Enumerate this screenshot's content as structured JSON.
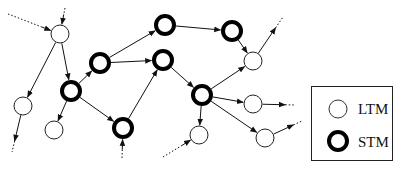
{
  "diagram": {
    "type": "network-graph",
    "node_types": {
      "ltm": {
        "label": "LTM",
        "stroke_width": 1,
        "stroke": "#222222"
      },
      "stm": {
        "label": "STM",
        "stroke_width": 4,
        "stroke": "#000000"
      }
    },
    "nodes": [
      {
        "id": "A",
        "type": "ltm",
        "x": 60,
        "y": 34
      },
      {
        "id": "B",
        "type": "ltm",
        "x": 23,
        "y": 106
      },
      {
        "id": "C",
        "type": "ltm",
        "x": 54,
        "y": 130
      },
      {
        "id": "D",
        "type": "stm",
        "x": 71,
        "y": 91
      },
      {
        "id": "E",
        "type": "stm",
        "x": 100,
        "y": 63
      },
      {
        "id": "F",
        "type": "stm",
        "x": 165,
        "y": 25
      },
      {
        "id": "G",
        "type": "stm",
        "x": 163,
        "y": 60
      },
      {
        "id": "H",
        "type": "stm",
        "x": 123,
        "y": 128
      },
      {
        "id": "I",
        "type": "stm",
        "x": 232,
        "y": 31
      },
      {
        "id": "J",
        "type": "ltm",
        "x": 253,
        "y": 61
      },
      {
        "id": "K",
        "type": "stm",
        "x": 202,
        "y": 95
      },
      {
        "id": "L",
        "type": "ltm",
        "x": 253,
        "y": 104
      },
      {
        "id": "M",
        "type": "ltm",
        "x": 199,
        "y": 135
      },
      {
        "id": "N",
        "type": "ltm",
        "x": 265,
        "y": 138
      }
    ],
    "edges": [
      [
        "A",
        "B"
      ],
      [
        "A",
        "D"
      ],
      [
        "D",
        "E"
      ],
      [
        "D",
        "C"
      ],
      [
        "D",
        "H"
      ],
      [
        "E",
        "F"
      ],
      [
        "E",
        "G"
      ],
      [
        "H",
        "G"
      ],
      [
        "G",
        "K"
      ],
      [
        "F",
        "I"
      ],
      [
        "I",
        "J"
      ],
      [
        "K",
        "J"
      ],
      [
        "K",
        "L"
      ],
      [
        "K",
        "M"
      ],
      [
        "K",
        "N"
      ]
    ],
    "dangling_edges": [
      {
        "note": "incoming to A from top-left",
        "from": [
          8,
          14
        ],
        "to": "A"
      },
      {
        "note": "incoming to A from top",
        "from": [
          65,
          8
        ],
        "to": "A"
      },
      {
        "note": "outgoing from B downward",
        "from": "B",
        "to": [
          12,
          152
        ]
      },
      {
        "note": "incoming to H from bottom",
        "from": [
          122,
          158
        ],
        "to": "H"
      },
      {
        "note": "incoming to M from bottom-left",
        "from": [
          163,
          157
        ],
        "to": "M"
      },
      {
        "note": "outgoing from J to top-right",
        "from": "J",
        "to": [
          283,
          17
        ]
      },
      {
        "note": "outgoing from L rightward",
        "from": "L",
        "to": [
          295,
          105
        ]
      },
      {
        "note": "outgoing from N to right",
        "from": "N",
        "to": [
          302,
          121
        ]
      }
    ]
  },
  "legend": {
    "items": [
      {
        "type": "ltm",
        "label": "LTM"
      },
      {
        "type": "stm",
        "label": "STM"
      }
    ]
  }
}
